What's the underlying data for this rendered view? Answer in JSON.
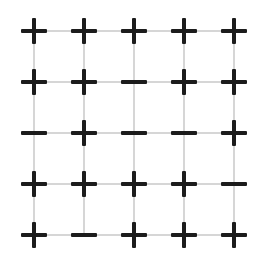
{
  "diagram": {
    "type": "spin-lattice",
    "rows": 5,
    "cols": 5,
    "col_x": [
      34,
      84,
      134,
      184,
      234
    ],
    "row_y": [
      31,
      82,
      133,
      184,
      235
    ],
    "colors": {
      "symbol": "#1c1c1c",
      "gridline": "#d6d6d6",
      "background": "#ffffff"
    },
    "grid": [
      [
        "+",
        "+",
        "+",
        "+",
        "+"
      ],
      [
        "+",
        "+",
        "-",
        "+",
        "+"
      ],
      [
        "-",
        "+",
        "-",
        "-",
        "+"
      ],
      [
        "+",
        "+",
        "+",
        "+",
        "-"
      ],
      [
        "+",
        "-",
        "+",
        "+",
        "+"
      ]
    ]
  }
}
